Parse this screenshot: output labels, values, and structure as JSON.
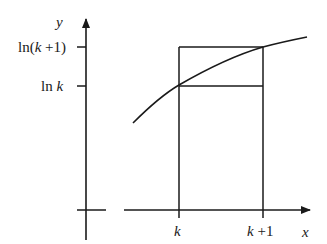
{
  "diagram": {
    "axes": {
      "x_label": "x",
      "y_label": "y"
    },
    "y_ticks": [
      {
        "label_prefix": "ln(",
        "label_var": "k",
        "label_suffix": " +1)",
        "position": "upper"
      },
      {
        "label_prefix": "ln ",
        "label_var": "k",
        "label_suffix": "",
        "position": "lower"
      }
    ],
    "x_ticks": [
      {
        "label_var": "k",
        "label_suffix": ""
      },
      {
        "label_var": "k",
        "label_suffix": " +1"
      }
    ],
    "curve": "y = ln x",
    "rectangles": [
      {
        "name": "lower-rectangle",
        "height_value": "ln k"
      },
      {
        "name": "upper-rectangle",
        "height_value": "ln(k+1)"
      }
    ],
    "stroke_color": "#1a1a1a"
  }
}
